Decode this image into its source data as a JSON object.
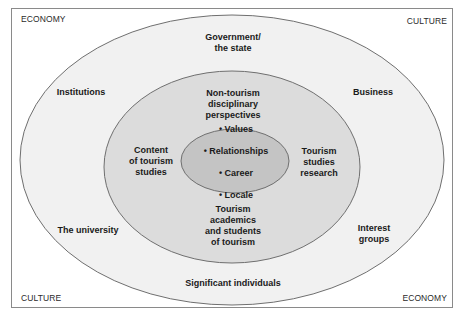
{
  "corners": {
    "top_left": "ECONOMY",
    "top_right": "CULTURE",
    "bottom_left": "CULTURE",
    "bottom_right": "ECONOMY"
  },
  "outer_ring": {
    "top": "Government/\nthe state",
    "upper_left": "Institutions",
    "upper_right": "Business",
    "lower_left": "The university",
    "lower_right": "Interest\ngroups",
    "bottom": "Significant individuals"
  },
  "middle_ring": {
    "top": "Non-tourism\ndisciplinary\nperspectives",
    "left": "Content\nof tourism\nstudies",
    "right": "Tourism\nstudies\nresearch",
    "bottom": "Tourism\nacademics\nand students\nof tourism"
  },
  "core": {
    "items": [
      "• Values",
      "• Relationships",
      "• Career",
      "• Locale"
    ]
  },
  "colors": {
    "outer_fill": "#f1f1f1",
    "middle_fill": "#dcdcdc",
    "core_fill": "#c4c4c4",
    "stroke": "#707070"
  }
}
